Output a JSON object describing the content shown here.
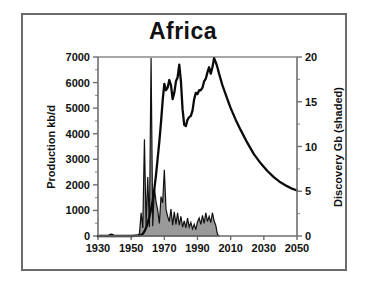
{
  "chart_data": {
    "type": "area",
    "title": "Africa",
    "xlabel": "",
    "ylabel": "Production kb/d",
    "y2label": "Discovery Gb (shaded)",
    "xlim": [
      1930,
      2050
    ],
    "ylim": [
      0,
      7000
    ],
    "y2lim": [
      0,
      20
    ],
    "xticks": [
      1930,
      1950,
      1970,
      1990,
      2010,
      2030,
      2050
    ],
    "xtick_labels": [
      "1930",
      "1950",
      "1970",
      "1990",
      "2010",
      "2030",
      "2050"
    ],
    "yticks": [
      0,
      1000,
      2000,
      3000,
      4000,
      5000,
      6000,
      7000
    ],
    "ytick_labels": [
      "0",
      "1000",
      "2000",
      "3000",
      "4000",
      "5000",
      "6000",
      "7000"
    ],
    "y2ticks": [
      0,
      5,
      10,
      15,
      20
    ],
    "y2tick_labels": [
      "0",
      "5",
      "10",
      "15",
      "20"
    ],
    "y_minor_step": 500,
    "y2_minor_step": 2.5,
    "grid": false,
    "legend_position": "none",
    "series": [
      {
        "name": "Discovery Gb (shaded)",
        "axis": "right",
        "style": "shaded-area",
        "color": "#9a9a9a",
        "x": [
          1930,
          1936,
          1937,
          1938,
          1939,
          1940,
          1941,
          1950,
          1954,
          1955,
          1956,
          1957,
          1958,
          1959,
          1960,
          1961,
          1962,
          1963,
          1964,
          1965,
          1966,
          1967,
          1968,
          1969,
          1970,
          1971,
          1972,
          1973,
          1974,
          1975,
          1976,
          1977,
          1978,
          1979,
          1980,
          1981,
          1982,
          1983,
          1984,
          1985,
          1986,
          1987,
          1988,
          1989,
          1990,
          1991,
          1992,
          1993,
          1994,
          1995,
          1996,
          1997,
          1998,
          1999,
          2000,
          2001,
          2002,
          2003
        ],
        "values": [
          0,
          0,
          0.15,
          0.2,
          0.15,
          0,
          0,
          0,
          0,
          0.3,
          2.6,
          0.9,
          10.8,
          1.2,
          6.6,
          1.0,
          19.9,
          1.1,
          5.4,
          3.8,
          2.9,
          1.4,
          4.4,
          3.7,
          7.4,
          3.0,
          2.2,
          1.6,
          3.0,
          1.2,
          2.7,
          1.3,
          2.6,
          1.2,
          2.2,
          1.0,
          1.7,
          0.9,
          2.0,
          1.0,
          1.5,
          0.8,
          1.3,
          0.7,
          1.6,
          2.0,
          1.3,
          2.3,
          1.4,
          2.6,
          1.6,
          2.2,
          1.5,
          2.6,
          1.7,
          1.2,
          0.2,
          0
        ]
      },
      {
        "name": "Production kb/d",
        "axis": "left",
        "style": "line",
        "color": "#0a0a0a",
        "x": [
          1930,
          1950,
          1955,
          1957,
          1958,
          1959,
          1960,
          1961,
          1962,
          1963,
          1964,
          1965,
          1966,
          1967,
          1968,
          1969,
          1970,
          1971,
          1972,
          1973,
          1974,
          1975,
          1976,
          1977,
          1978,
          1979,
          1980,
          1981,
          1982,
          1983,
          1984,
          1985,
          1986,
          1987,
          1988,
          1989,
          1990,
          1991,
          1992,
          1993,
          1994,
          1995,
          1996,
          1997,
          1998,
          1999,
          2000,
          2001,
          2002,
          2003,
          2005,
          2008,
          2010,
          2013,
          2016,
          2020,
          2024,
          2028,
          2032,
          2036,
          2040,
          2044,
          2047,
          2050
        ],
        "values": [
          0,
          0,
          20,
          80,
          180,
          320,
          520,
          760,
          1050,
          1400,
          1850,
          2400,
          3050,
          3700,
          4450,
          5300,
          5950,
          5700,
          5800,
          6100,
          5900,
          5350,
          5600,
          6050,
          6200,
          6700,
          6050,
          4950,
          4350,
          4300,
          4550,
          4650,
          4700,
          4900,
          5350,
          5600,
          5550,
          5700,
          5700,
          5800,
          6050,
          6150,
          6400,
          6600,
          6350,
          6600,
          6950,
          6800,
          6600,
          6350,
          5900,
          5350,
          5000,
          4550,
          4150,
          3650,
          3200,
          2850,
          2550,
          2300,
          2100,
          1950,
          1850,
          1780
        ]
      }
    ]
  },
  "axes": {
    "left_title": "Production kb/d",
    "right_title": "Discovery Gb (shaded)"
  }
}
